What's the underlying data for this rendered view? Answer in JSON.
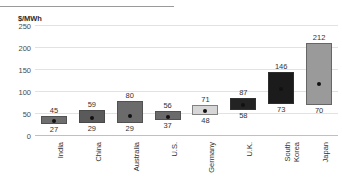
{
  "chart_data": {
    "type": "bar",
    "subtype": "floating-range-bar-with-midpoint",
    "title": "",
    "xlabel": "",
    "ylabel": "$/MWh",
    "unit_label": "$/MWh",
    "ylim": [
      0,
      250
    ],
    "yticks": [
      0,
      50,
      100,
      150,
      200,
      250
    ],
    "ytick_labels": [
      "0",
      "50",
      "100",
      "150",
      "200",
      "250"
    ],
    "grid": true,
    "legend": "none",
    "categories": [
      "India",
      "China",
      "Australia",
      "U.S.",
      "Germany",
      "U.K.",
      "South Korea",
      "Japan"
    ],
    "low_values": [
      27,
      29,
      29,
      37,
      48,
      58,
      73,
      70
    ],
    "high_values": [
      45,
      59,
      80,
      56,
      71,
      87,
      146,
      212
    ],
    "midpoints": [
      34,
      40,
      45,
      44,
      56,
      70,
      107,
      118
    ],
    "series": [
      {
        "name": "Low",
        "values": [
          27,
          29,
          29,
          37,
          48,
          58,
          73,
          70
        ]
      },
      {
        "name": "High",
        "values": [
          45,
          59,
          80,
          56,
          71,
          87,
          146,
          212
        ]
      }
    ],
    "bar_colors": [
      "#6e6e6e",
      "#5a5a5a",
      "#6b6b6b",
      "#6a6a6a",
      "#d6d6d6",
      "#232323",
      "#1b1b1b",
      "#9a9a9a"
    ],
    "top_labels": [
      "45",
      "59",
      "80",
      "56",
      "71",
      "87",
      "146",
      "212"
    ],
    "bottom_labels": [
      "27",
      "29",
      "29",
      "37",
      "48",
      "58",
      "73",
      "70"
    ]
  },
  "axis": {
    "unit": "$/MWh"
  }
}
